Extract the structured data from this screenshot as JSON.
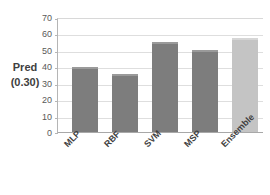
{
  "chart_data": {
    "type": "bar",
    "title": "",
    "xlabel": "",
    "ylabel": "Pred (0.30)",
    "ylabel_lines": [
      "Pred",
      "(0.30)"
    ],
    "categories": [
      "MLP",
      "RBF",
      "SVM",
      "MSP",
      "Ensemble"
    ],
    "values": [
      40,
      36,
      56,
      51,
      58.5
    ],
    "ylim": [
      0,
      70
    ],
    "ytick_labels": [
      "70",
      "60",
      "50",
      "40",
      "30",
      "20",
      "10",
      "0"
    ],
    "ytick_values": [
      70,
      60,
      50,
      40,
      30,
      20,
      10,
      0
    ],
    "grid": true,
    "legend": false,
    "series": [
      {
        "name": "Pred (0.30)",
        "values": [
          40,
          36,
          56,
          51,
          58.5
        ]
      }
    ],
    "bar_colors": [
      "#7d7d7d",
      "#7d7d7d",
      "#7d7d7d",
      "#7d7d7d",
      "#c4c4c4"
    ],
    "colors": {
      "bar_primary": "#7d7d7d",
      "bar_highlight": "#c4c4c4",
      "gridline": "#dedede",
      "axis": "#b5b5b5",
      "text": "#3f3f3f",
      "background": "#ffffff"
    }
  }
}
